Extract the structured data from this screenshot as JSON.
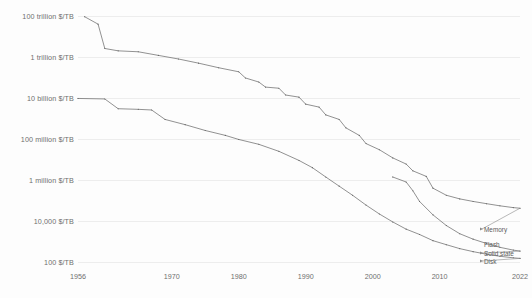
{
  "chart_data": {
    "type": "line",
    "title": "",
    "subtitle": "",
    "xlabel": "",
    "ylabel": "",
    "xlim": [
      1956,
      2022
    ],
    "ylim": [
      100,
      100000000000000
    ],
    "yscale": "log",
    "grid": true,
    "legend_position": "right-inline",
    "xticks": [
      1956,
      1970,
      1980,
      1990,
      2000,
      2010,
      2022
    ],
    "xticklabels": [
      "1956",
      "1970",
      "1980",
      "1990",
      "2000",
      "2010",
      "2022"
    ],
    "yticks": [
      100000000000000,
      1000000000000,
      10000000000,
      100000000,
      1000000,
      10000,
      100
    ],
    "yticklabels": [
      "100 trillion $/TB",
      "1 trillion $/TB",
      "10 billion $/TB",
      "100 million $/TB",
      "1 million $/TB",
      "10,000 $/TB",
      "100 $/TB"
    ],
    "series": [
      {
        "name": "Memory",
        "label": "Memory",
        "color": "#6e6e6e",
        "points": [
          [
            1957,
            92000000000000
          ],
          [
            1959,
            40000000000000
          ],
          [
            1960,
            2600000000000
          ],
          [
            1962,
            2000000000000
          ],
          [
            1965,
            1800000000000
          ],
          [
            1968,
            1200000000000
          ],
          [
            1971,
            800000000000
          ],
          [
            1974,
            500000000000
          ],
          [
            1977,
            300000000000
          ],
          [
            1980,
            190000000000
          ],
          [
            1981,
            95000000000
          ],
          [
            1983,
            60000000000
          ],
          [
            1984,
            34000000000
          ],
          [
            1986,
            30000000000
          ],
          [
            1987,
            14000000000
          ],
          [
            1989,
            11000000000
          ],
          [
            1990,
            5000000000
          ],
          [
            1992,
            3600000000
          ],
          [
            1993,
            1500000000
          ],
          [
            1995,
            900000000
          ],
          [
            1996,
            350000000
          ],
          [
            1998,
            150000000
          ],
          [
            1999,
            60000000
          ],
          [
            2001,
            30000000
          ],
          [
            2003,
            12000000
          ],
          [
            2005,
            6000000
          ],
          [
            2006,
            2800000
          ],
          [
            2008,
            1500000
          ],
          [
            2009,
            400000
          ],
          [
            2011,
            180000
          ],
          [
            2013,
            120000
          ],
          [
            2015,
            90000
          ],
          [
            2017,
            70000
          ],
          [
            2019,
            55000
          ],
          [
            2021,
            45000
          ],
          [
            2022,
            42000
          ]
        ]
      },
      {
        "name": "Disk",
        "label": "Disk",
        "color": "#6e6e6e",
        "points": [
          [
            1956,
            9500000000
          ],
          [
            1960,
            9000000000
          ],
          [
            1962,
            3000000000
          ],
          [
            1965,
            2800000000
          ],
          [
            1967,
            2600000000
          ],
          [
            1969,
            900000000
          ],
          [
            1972,
            500000000
          ],
          [
            1975,
            260000000
          ],
          [
            1978,
            150000000
          ],
          [
            1980,
            95000000
          ],
          [
            1983,
            55000000
          ],
          [
            1986,
            25000000
          ],
          [
            1989,
            9000000
          ],
          [
            1991,
            4000000
          ],
          [
            1993,
            1400000
          ],
          [
            1995,
            500000
          ],
          [
            1997,
            180000
          ],
          [
            1999,
            60000
          ],
          [
            2001,
            22000
          ],
          [
            2003,
            9000
          ],
          [
            2005,
            4000
          ],
          [
            2007,
            2200
          ],
          [
            2009,
            1100
          ],
          [
            2011,
            700
          ],
          [
            2013,
            450
          ],
          [
            2015,
            320
          ],
          [
            2017,
            240
          ],
          [
            2019,
            190
          ],
          [
            2021,
            160
          ],
          [
            2022,
            150
          ]
        ]
      },
      {
        "name": "Flash / Solid state",
        "label": "Flash",
        "color": "#6e6e6e",
        "points": [
          [
            2003,
            1400000
          ],
          [
            2005,
            800000
          ],
          [
            2006,
            300000
          ],
          [
            2007,
            90000
          ],
          [
            2009,
            20000
          ],
          [
            2011,
            6000
          ],
          [
            2013,
            2400
          ],
          [
            2015,
            1300
          ],
          [
            2017,
            800
          ],
          [
            2019,
            520
          ],
          [
            2021,
            380
          ],
          [
            2022,
            340
          ]
        ]
      }
    ],
    "annotations": [
      {
        "text": "Memory",
        "x": 2022,
        "y": 42000
      },
      {
        "text": "Flash",
        "x": 2022,
        "y": 340
      },
      {
        "text": "Solid state",
        "x": 2022,
        "y": 340
      },
      {
        "text": "Disk",
        "x": 2022,
        "y": 150
      }
    ]
  }
}
